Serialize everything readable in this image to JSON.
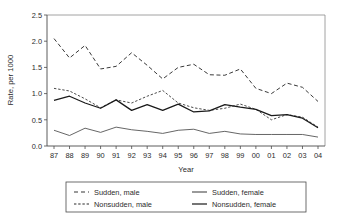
{
  "chart_data": {
    "type": "line",
    "title": "",
    "xlabel": "Year",
    "ylabel": "Rate, per 1000",
    "xlim": [
      0,
      17
    ],
    "ylim": [
      0.0,
      2.5
    ],
    "grid": false,
    "legend_position": "bottom",
    "categories": [
      "87",
      "88",
      "89",
      "90",
      "91",
      "92",
      "93",
      "94",
      "95",
      "96",
      "97",
      "98",
      "99",
      "00",
      "01",
      "02",
      "03",
      "04"
    ],
    "ytick_labels": [
      "0.0",
      "0.5",
      "1.0",
      "1.5",
      "2.0",
      "2.5"
    ],
    "ytick_values": [
      0.0,
      0.5,
      1.0,
      1.5,
      2.0,
      2.5
    ],
    "series": [
      {
        "name": "Sudden, male",
        "style": "long-dash",
        "color": "#3a3a3a",
        "width": 1.0,
        "values": [
          2.05,
          1.68,
          1.92,
          1.47,
          1.52,
          1.78,
          1.54,
          1.28,
          1.5,
          1.56,
          1.36,
          1.35,
          1.47,
          1.1,
          1.0,
          1.2,
          1.12,
          0.85
        ]
      },
      {
        "name": "Nonsudden, male",
        "style": "short-dash",
        "color": "#4a4a4a",
        "width": 1.0,
        "values": [
          1.1,
          1.05,
          0.9,
          0.73,
          0.88,
          0.82,
          0.95,
          1.06,
          0.82,
          0.73,
          0.68,
          0.72,
          0.8,
          0.7,
          0.5,
          0.6,
          0.55,
          0.36
        ]
      },
      {
        "name": "Nonsudden, female",
        "style": "solid",
        "color": "#1a1a1a",
        "width": 1.25,
        "values": [
          0.87,
          0.95,
          0.82,
          0.72,
          0.88,
          0.68,
          0.79,
          0.68,
          0.8,
          0.65,
          0.67,
          0.79,
          0.74,
          0.7,
          0.58,
          0.6,
          0.53,
          0.35
        ]
      },
      {
        "name": "Sudden, female",
        "style": "solid",
        "color": "#555555",
        "width": 0.9,
        "values": [
          0.3,
          0.2,
          0.34,
          0.26,
          0.36,
          0.31,
          0.28,
          0.24,
          0.3,
          0.32,
          0.24,
          0.28,
          0.23,
          0.22,
          0.22,
          0.22,
          0.22,
          0.17
        ]
      }
    ],
    "legend_entries": [
      {
        "label": "Sudden, male",
        "style": "long-dash",
        "column": 0,
        "row": 0
      },
      {
        "label": "Sudden, female",
        "style": "solid-thin",
        "column": 1,
        "row": 0
      },
      {
        "label": "Nonsudden, male",
        "style": "short-dash",
        "column": 0,
        "row": 1
      },
      {
        "label": "Nonsudden, female",
        "style": "solid-thick",
        "column": 1,
        "row": 1
      }
    ]
  }
}
